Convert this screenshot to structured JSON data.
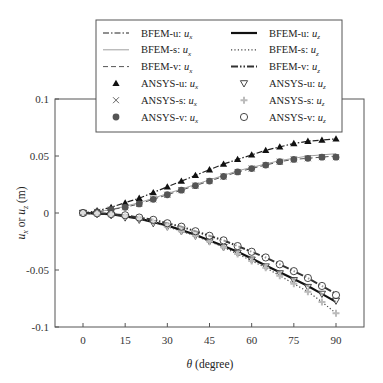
{
  "chart_data": {
    "type": "line",
    "title": "",
    "xlabel": "θ (degree)",
    "ylabel": "ux or uz (m)",
    "xlim": [
      -10,
      100
    ],
    "ylim": [
      -0.1,
      0.1
    ],
    "xticks": [
      0,
      15,
      30,
      45,
      60,
      75,
      90
    ],
    "yticks": [
      0.1,
      0.05,
      0,
      -0.05,
      -0.1
    ],
    "ytick_labels": [
      "0.1",
      "0.05",
      "0",
      "-0.05",
      "-0.1"
    ],
    "grid": false,
    "legend_position": "top, above plot",
    "x": [
      0,
      5,
      10,
      15,
      20,
      25,
      30,
      35,
      40,
      45,
      50,
      55,
      60,
      65,
      70,
      75,
      80,
      85,
      90
    ],
    "series": [
      {
        "name": "BFEM-u: ux",
        "style": "dash-dot",
        "color": "#222222",
        "values": [
          0,
          0.002,
          0.005,
          0.009,
          0.013,
          0.018,
          0.023,
          0.028,
          0.033,
          0.038,
          0.043,
          0.047,
          0.051,
          0.055,
          0.058,
          0.061,
          0.063,
          0.064,
          0.065
        ]
      },
      {
        "name": "BFEM-s: ux",
        "style": "solid-thin",
        "color": "#888888",
        "values": [
          0,
          0.001,
          0.003,
          0.006,
          0.009,
          0.013,
          0.017,
          0.021,
          0.025,
          0.029,
          0.033,
          0.037,
          0.04,
          0.043,
          0.046,
          0.048,
          0.05,
          0.051,
          0.052
        ]
      },
      {
        "name": "BFEM-v: ux",
        "style": "dashed",
        "color": "#555555",
        "values": [
          0,
          0.001,
          0.003,
          0.005,
          0.008,
          0.012,
          0.016,
          0.02,
          0.024,
          0.028,
          0.032,
          0.036,
          0.039,
          0.042,
          0.045,
          0.047,
          0.048,
          0.049,
          0.05
        ]
      },
      {
        "name": "BFEM-u: uz",
        "style": "solid-thick",
        "color": "#111111",
        "values": [
          0,
          -0.0005,
          -0.001,
          -0.003,
          -0.005,
          -0.008,
          -0.011,
          -0.015,
          -0.019,
          -0.024,
          -0.029,
          -0.034,
          -0.04,
          -0.046,
          -0.052,
          -0.058,
          -0.064,
          -0.071,
          -0.078
        ]
      },
      {
        "name": "BFEM-s: uz",
        "style": "dotted",
        "color": "#444444",
        "values": [
          0,
          -0.0005,
          -0.001,
          -0.003,
          -0.005,
          -0.008,
          -0.012,
          -0.016,
          -0.02,
          -0.025,
          -0.03,
          -0.036,
          -0.042,
          -0.048,
          -0.055,
          -0.062,
          -0.069,
          -0.078,
          -0.088
        ]
      },
      {
        "name": "BFEM-v: uz",
        "style": "dash-dot-dot-thick",
        "color": "#333333",
        "values": [
          0,
          -0.0003,
          -0.001,
          -0.002,
          -0.004,
          -0.006,
          -0.009,
          -0.012,
          -0.016,
          -0.02,
          -0.024,
          -0.029,
          -0.034,
          -0.039,
          -0.045,
          -0.051,
          -0.057,
          -0.064,
          -0.071
        ]
      },
      {
        "name": "ANSYS-u: ux",
        "marker": "triangle-up-filled",
        "color": "#111111",
        "values": [
          0,
          0.002,
          0.005,
          0.009,
          0.013,
          0.018,
          0.023,
          0.028,
          0.033,
          0.038,
          0.043,
          0.047,
          0.051,
          0.055,
          0.058,
          0.061,
          0.063,
          0.064,
          0.065
        ]
      },
      {
        "name": "ANSYS-s: ux",
        "marker": "x",
        "color": "#555555",
        "values": [
          0,
          0.001,
          0.003,
          0.005,
          0.008,
          0.012,
          0.016,
          0.02,
          0.024,
          0.028,
          0.032,
          0.036,
          0.039,
          0.042,
          0.045,
          0.047,
          0.048,
          0.049,
          0.049
        ]
      },
      {
        "name": "ANSYS-v: ux",
        "marker": "circle-filled",
        "color": "#555555",
        "values": [
          0,
          0.001,
          0.003,
          0.005,
          0.008,
          0.012,
          0.016,
          0.02,
          0.024,
          0.028,
          0.032,
          0.036,
          0.039,
          0.042,
          0.045,
          0.047,
          0.048,
          0.049,
          0.049
        ]
      },
      {
        "name": "ANSYS-u: uz",
        "marker": "triangle-down-open",
        "color": "#333333",
        "values": [
          0,
          -0.001,
          -0.002,
          -0.004,
          -0.006,
          -0.009,
          -0.012,
          -0.016,
          -0.02,
          -0.025,
          -0.03,
          -0.035,
          -0.041,
          -0.047,
          -0.053,
          -0.059,
          -0.065,
          -0.071,
          -0.077
        ]
      },
      {
        "name": "ANSYS-s: uz",
        "marker": "plus-light",
        "color": "#bbbbbb",
        "values": [
          0,
          -0.0005,
          -0.001,
          -0.003,
          -0.005,
          -0.008,
          -0.012,
          -0.016,
          -0.02,
          -0.025,
          -0.03,
          -0.036,
          -0.042,
          -0.048,
          -0.055,
          -0.062,
          -0.069,
          -0.078,
          -0.088
        ]
      },
      {
        "name": "ANSYS-v: uz",
        "marker": "circle-open",
        "color": "#333333",
        "values": [
          0,
          -0.0003,
          -0.001,
          -0.002,
          -0.004,
          -0.006,
          -0.009,
          -0.012,
          -0.016,
          -0.02,
          -0.024,
          -0.029,
          -0.034,
          -0.039,
          -0.045,
          -0.051,
          -0.057,
          -0.064,
          -0.072
        ]
      }
    ]
  },
  "legend": {
    "left": [
      {
        "label": "BFEM-u: ",
        "sub": "x",
        "series": 0
      },
      {
        "label": "BFEM-s: ",
        "sub": "x",
        "series": 1
      },
      {
        "label": "BFEM-v: ",
        "sub": "x",
        "series": 2
      },
      {
        "label": "ANSYS-u: ",
        "sub": "x",
        "series": 6
      },
      {
        "label": "ANSYS-s: ",
        "sub": "x",
        "series": 7
      },
      {
        "label": "ANSYS-v: ",
        "sub": "x",
        "series": 8
      }
    ],
    "right": [
      {
        "label": "BFEM-u: ",
        "sub": "z",
        "series": 3
      },
      {
        "label": "BFEM-s: ",
        "sub": "z",
        "series": 4
      },
      {
        "label": "BFEM-v: ",
        "sub": "z",
        "series": 5
      },
      {
        "label": "ANSYS-u: ",
        "sub": "z",
        "series": 9
      },
      {
        "label": "ANSYS-s: ",
        "sub": "z",
        "series": 10
      },
      {
        "label": "ANSYS-v: ",
        "sub": "z",
        "series": 11
      }
    ]
  },
  "axes": {
    "xlabel_theta": "θ",
    "xlabel_rest": " (degree)",
    "ylabel_u1": "u",
    "ylabel_sub1": "x",
    "ylabel_or": " or ",
    "ylabel_u2": "u",
    "ylabel_sub2": "z",
    "ylabel_unit": " (m)"
  }
}
